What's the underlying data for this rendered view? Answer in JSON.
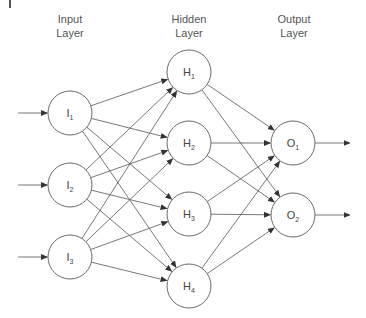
{
  "diagram": {
    "type": "feedforward-neural-network",
    "layers": [
      {
        "id": "input",
        "label_line1": "Input",
        "label_line2": "Layer",
        "x": 70
      },
      {
        "id": "hidden",
        "label_line1": "Hidden",
        "label_line2": "Layer",
        "x": 189
      },
      {
        "id": "output",
        "label_line1": "Output",
        "label_line2": "Layer",
        "x": 293
      }
    ],
    "nodes": [
      {
        "id": "I1",
        "letter": "I",
        "sub": "1",
        "layer": "input",
        "cx": 70,
        "cy": 113
      },
      {
        "id": "I2",
        "letter": "I",
        "sub": "2",
        "layer": "input",
        "cx": 70,
        "cy": 185
      },
      {
        "id": "I3",
        "letter": "I",
        "sub": "3",
        "layer": "input",
        "cx": 70,
        "cy": 257
      },
      {
        "id": "H1",
        "letter": "H",
        "sub": "1",
        "layer": "hidden",
        "cx": 189,
        "cy": 72
      },
      {
        "id": "H2",
        "letter": "H",
        "sub": "2",
        "layer": "hidden",
        "cx": 189,
        "cy": 143
      },
      {
        "id": "H3",
        "letter": "H",
        "sub": "3",
        "layer": "hidden",
        "cx": 189,
        "cy": 214
      },
      {
        "id": "H4",
        "letter": "H",
        "sub": "4",
        "layer": "hidden",
        "cx": 189,
        "cy": 286
      },
      {
        "id": "O1",
        "letter": "O",
        "sub": "1",
        "layer": "output",
        "cx": 293,
        "cy": 143
      },
      {
        "id": "O2",
        "letter": "O",
        "sub": "2",
        "layer": "output",
        "cx": 293,
        "cy": 215
      }
    ],
    "node_radius": 22,
    "input_arrows": [
      {
        "to": "I1",
        "x1": 18
      },
      {
        "to": "I2",
        "x1": 18
      },
      {
        "to": "I3",
        "x1": 18
      }
    ],
    "output_arrows": [
      {
        "from": "O1",
        "x2": 350
      },
      {
        "from": "O2",
        "x2": 350
      }
    ],
    "edges": [
      [
        "I1",
        "H1"
      ],
      [
        "I1",
        "H2"
      ],
      [
        "I1",
        "H3"
      ],
      [
        "I1",
        "H4"
      ],
      [
        "I2",
        "H1"
      ],
      [
        "I2",
        "H2"
      ],
      [
        "I2",
        "H3"
      ],
      [
        "I2",
        "H4"
      ],
      [
        "I3",
        "H1"
      ],
      [
        "I3",
        "H2"
      ],
      [
        "I3",
        "H3"
      ],
      [
        "I3",
        "H4"
      ],
      [
        "H1",
        "O1"
      ],
      [
        "H1",
        "O2"
      ],
      [
        "H2",
        "O1"
      ],
      [
        "H2",
        "O2"
      ],
      [
        "H3",
        "O1"
      ],
      [
        "H3",
        "O2"
      ],
      [
        "H4",
        "O1"
      ],
      [
        "H4",
        "O2"
      ]
    ],
    "colors": {
      "stroke": "#555555",
      "node_stroke": "#6a6a6a",
      "text": "#444444",
      "background": "#ffffff"
    }
  }
}
